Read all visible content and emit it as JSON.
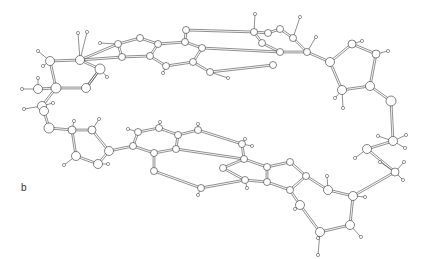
{
  "figure": {
    "panel_label": "b",
    "colors": {
      "background": "#ffffff",
      "line": "#444444",
      "atom_fill": "#ffffff"
    }
  },
  "atoms": [
    {
      "id": "a1",
      "x": 118,
      "y": 44,
      "r": 3.5
    },
    {
      "id": "a2",
      "x": 140,
      "y": 38,
      "r": 3.5
    },
    {
      "id": "a3",
      "x": 158,
      "y": 44,
      "r": 3.5
    },
    {
      "id": "a4",
      "x": 122,
      "y": 57,
      "r": 3.5
    },
    {
      "id": "a5",
      "x": 150,
      "y": 56,
      "r": 3.5
    },
    {
      "id": "a6",
      "x": 166,
      "y": 66,
      "r": 3.5
    },
    {
      "id": "a7",
      "x": 185,
      "y": 42,
      "r": 3.5
    },
    {
      "id": "a8",
      "x": 186,
      "y": 30,
      "r": 3.5
    },
    {
      "id": "a9",
      "x": 202,
      "y": 48,
      "r": 3.5
    },
    {
      "id": "a10",
      "x": 193,
      "y": 62,
      "r": 3.5
    },
    {
      "id": "a11",
      "x": 210,
      "y": 72,
      "r": 3.5
    },
    {
      "id": "a12",
      "x": 254,
      "y": 32,
      "r": 3.5
    },
    {
      "id": "a13",
      "x": 268,
      "y": 33,
      "r": 3.5
    },
    {
      "id": "a14",
      "x": 262,
      "y": 43,
      "r": 3.5
    },
    {
      "id": "a15",
      "x": 280,
      "y": 29,
      "r": 3.5
    },
    {
      "id": "a16",
      "x": 293,
      "y": 38,
      "r": 3.5
    },
    {
      "id": "a17",
      "x": 280,
      "y": 52,
      "r": 3.5
    },
    {
      "id": "a18",
      "x": 307,
      "y": 52,
      "r": 3.5
    },
    {
      "id": "a19",
      "x": 273,
      "y": 65,
      "r": 3.5
    },
    {
      "id": "a20",
      "x": 330,
      "y": 62,
      "r": 4.5
    },
    {
      "id": "a21",
      "x": 352,
      "y": 44,
      "r": 4
    },
    {
      "id": "a22",
      "x": 376,
      "y": 54,
      "r": 4
    },
    {
      "id": "a23",
      "x": 342,
      "y": 90,
      "r": 4.5
    },
    {
      "id": "a24",
      "x": 370,
      "y": 86,
      "r": 4.5
    },
    {
      "id": "a25",
      "x": 391,
      "y": 101,
      "r": 5
    },
    {
      "id": "a26",
      "x": 393,
      "y": 141,
      "r": 4.5
    },
    {
      "id": "a27",
      "x": 367,
      "y": 149,
      "r": 4.5
    },
    {
      "id": "a28",
      "x": 395,
      "y": 172,
      "r": 4
    },
    {
      "id": "a29",
      "x": 80,
      "y": 60,
      "r": 4.5
    },
    {
      "id": "a30",
      "x": 50,
      "y": 61,
      "r": 4.5
    },
    {
      "id": "a31",
      "x": 100,
      "y": 69,
      "r": 5
    },
    {
      "id": "a32",
      "x": 56,
      "y": 88,
      "r": 5
    },
    {
      "id": "a33",
      "x": 86,
      "y": 88,
      "r": 4.5
    },
    {
      "id": "a34",
      "x": 38,
      "y": 89,
      "r": 4.5
    },
    {
      "id": "a35",
      "x": 42,
      "y": 106,
      "r": 4.5
    },
    {
      "id": "a36",
      "x": 44,
      "y": 111,
      "r": 4.5
    },
    {
      "id": "a37",
      "x": 49,
      "y": 128,
      "r": 5
    },
    {
      "id": "a38",
      "x": 72,
      "y": 130,
      "r": 4
    },
    {
      "id": "a39",
      "x": 92,
      "y": 130,
      "r": 4
    },
    {
      "id": "a40",
      "x": 76,
      "y": 156,
      "r": 4.5
    },
    {
      "id": "a41",
      "x": 98,
      "y": 164,
      "r": 4.5
    },
    {
      "id": "a42",
      "x": 109,
      "y": 151,
      "r": 4.5
    },
    {
      "id": "a43",
      "x": 133,
      "y": 146,
      "r": 3.5
    },
    {
      "id": "a44",
      "x": 138,
      "y": 132,
      "r": 3.5
    },
    {
      "id": "a45",
      "x": 159,
      "y": 128,
      "r": 3.5
    },
    {
      "id": "a46",
      "x": 154,
      "y": 153,
      "r": 3.5
    },
    {
      "id": "a47",
      "x": 176,
      "y": 149,
      "r": 3.5
    },
    {
      "id": "a48",
      "x": 178,
      "y": 135,
      "r": 3.5
    },
    {
      "id": "a49",
      "x": 198,
      "y": 130,
      "r": 3.5
    },
    {
      "id": "a50",
      "x": 154,
      "y": 171,
      "r": 3.5
    },
    {
      "id": "a51",
      "x": 201,
      "y": 188,
      "r": 3.5
    },
    {
      "id": "a52",
      "x": 242,
      "y": 144,
      "r": 3.5
    },
    {
      "id": "a53",
      "x": 244,
      "y": 159,
      "r": 3.5
    },
    {
      "id": "a54",
      "x": 223,
      "y": 168,
      "r": 3.5
    },
    {
      "id": "a55",
      "x": 245,
      "y": 180,
      "r": 3.5
    },
    {
      "id": "a56",
      "x": 267,
      "y": 167,
      "r": 3.5
    },
    {
      "id": "a57",
      "x": 267,
      "y": 182,
      "r": 3.5
    },
    {
      "id": "a58",
      "x": 290,
      "y": 190,
      "r": 3.5
    },
    {
      "id": "a59",
      "x": 290,
      "y": 162,
      "r": 3.5
    },
    {
      "id": "a60",
      "x": 306,
      "y": 176,
      "r": 3.5
    },
    {
      "id": "a61",
      "x": 300,
      "y": 205,
      "r": 4.5
    },
    {
      "id": "a62",
      "x": 328,
      "y": 190,
      "r": 4.5
    },
    {
      "id": "a63",
      "x": 353,
      "y": 196,
      "r": 4.5
    },
    {
      "id": "a64",
      "x": 320,
      "y": 232,
      "r": 4.5
    },
    {
      "id": "a65",
      "x": 350,
      "y": 225,
      "r": 4.5
    }
  ],
  "hydrogens": [
    {
      "x": 255,
      "y": 14
    },
    {
      "x": 300,
      "y": 17
    },
    {
      "x": 316,
      "y": 37
    },
    {
      "x": 228,
      "y": 78
    },
    {
      "x": 163,
      "y": 73
    },
    {
      "x": 100,
      "y": 43
    },
    {
      "x": 78,
      "y": 33
    },
    {
      "x": 87,
      "y": 32
    },
    {
      "x": 38,
      "y": 51
    },
    {
      "x": 43,
      "y": 66
    },
    {
      "x": 107,
      "y": 77
    },
    {
      "x": 38,
      "y": 78
    },
    {
      "x": 22,
      "y": 89
    },
    {
      "x": 53,
      "y": 103
    },
    {
      "x": 24,
      "y": 109
    },
    {
      "x": 362,
      "y": 41
    },
    {
      "x": 388,
      "y": 51
    },
    {
      "x": 335,
      "y": 98
    },
    {
      "x": 343,
      "y": 108
    },
    {
      "x": 406,
      "y": 135
    },
    {
      "x": 405,
      "y": 148
    },
    {
      "x": 378,
      "y": 136
    },
    {
      "x": 404,
      "y": 162
    },
    {
      "x": 403,
      "y": 180
    },
    {
      "x": 74,
      "y": 121
    },
    {
      "x": 99,
      "y": 119
    },
    {
      "x": 64,
      "y": 165
    },
    {
      "x": 108,
      "y": 164
    },
    {
      "x": 128,
      "y": 129
    },
    {
      "x": 160,
      "y": 122
    },
    {
      "x": 198,
      "y": 124
    },
    {
      "x": 198,
      "y": 195
    },
    {
      "x": 245,
      "y": 139
    },
    {
      "x": 252,
      "y": 146
    },
    {
      "x": 247,
      "y": 188
    },
    {
      "x": 327,
      "y": 176
    },
    {
      "x": 295,
      "y": 209
    },
    {
      "x": 365,
      "y": 197
    },
    {
      "x": 361,
      "y": 237
    },
    {
      "x": 318,
      "y": 238
    },
    {
      "x": 318,
      "y": 255
    },
    {
      "x": 355,
      "y": 158
    },
    {
      "x": 380,
      "y": 162
    }
  ],
  "bonds": [
    [
      "a1",
      "a2"
    ],
    [
      "a2",
      "a3"
    ],
    [
      "a1",
      "a4"
    ],
    [
      "a3",
      "a5"
    ],
    [
      "a4",
      "a5"
    ],
    [
      "a5",
      "a6"
    ],
    [
      "a3",
      "a7"
    ],
    [
      "a7",
      "a8"
    ],
    [
      "a7",
      "a9"
    ],
    [
      "a9",
      "a10"
    ],
    [
      "a6",
      "a10"
    ],
    [
      "a10",
      "a11"
    ],
    [
      "a8",
      "a12"
    ],
    [
      "a9",
      "a17"
    ],
    [
      "a11",
      "a19"
    ],
    [
      "a12",
      "a13"
    ],
    [
      "a12",
      "a14"
    ],
    [
      "a13",
      "a15"
    ],
    [
      "a15",
      "a16"
    ],
    [
      "a14",
      "a17"
    ],
    [
      "a16",
      "a18"
    ],
    [
      "a17",
      "a18"
    ],
    [
      "a18",
      "a20"
    ],
    [
      "a20",
      "a21"
    ],
    [
      "a21",
      "a22"
    ],
    [
      "a20",
      "a23"
    ],
    [
      "a22",
      "a24"
    ],
    [
      "a23",
      "a24"
    ],
    [
      "a24",
      "a25"
    ],
    [
      "a25",
      "a26"
    ],
    [
      "a26",
      "a27"
    ],
    [
      "a27",
      "a28"
    ],
    [
      "a1",
      "a29"
    ],
    [
      "a4",
      "a29"
    ],
    [
      "a29",
      "a31"
    ],
    [
      "a29",
      "a30"
    ],
    [
      "a30",
      "a32"
    ],
    [
      "a31",
      "a33"
    ],
    [
      "a32",
      "a33"
    ],
    [
      "a31",
      "a33"
    ],
    [
      "a32",
      "a34"
    ],
    [
      "a32",
      "a35"
    ],
    [
      "a35",
      "a36"
    ],
    [
      "a36",
      "a37"
    ],
    [
      "a37",
      "a38"
    ],
    [
      "a38",
      "a39"
    ],
    [
      "a38",
      "a40"
    ],
    [
      "a39",
      "a42"
    ],
    [
      "a40",
      "a41"
    ],
    [
      "a41",
      "a42"
    ],
    [
      "a42",
      "a43"
    ],
    [
      "a43",
      "a44"
    ],
    [
      "a44",
      "a45"
    ],
    [
      "a43",
      "a46"
    ],
    [
      "a45",
      "a48"
    ],
    [
      "a46",
      "a47"
    ],
    [
      "a47",
      "a48"
    ],
    [
      "a48",
      "a49"
    ],
    [
      "a46",
      "a50"
    ],
    [
      "a49",
      "a52"
    ],
    [
      "a50",
      "a51"
    ],
    [
      "a47",
      "a53"
    ],
    [
      "a51",
      "a55"
    ],
    [
      "a52",
      "a53"
    ],
    [
      "a53",
      "a54"
    ],
    [
      "a54",
      "a55"
    ],
    [
      "a53",
      "a56"
    ],
    [
      "a55",
      "a57"
    ],
    [
      "a56",
      "a57"
    ],
    [
      "a56",
      "a59"
    ],
    [
      "a57",
      "a58"
    ],
    [
      "a58",
      "a60"
    ],
    [
      "a59",
      "a60"
    ],
    [
      "a60",
      "a62"
    ],
    [
      "a58",
      "a61"
    ],
    [
      "a61",
      "a64"
    ],
    [
      "a62",
      "a63"
    ],
    [
      "a63",
      "a65"
    ],
    [
      "a64",
      "a65"
    ],
    [
      "a63",
      "a28"
    ]
  ]
}
